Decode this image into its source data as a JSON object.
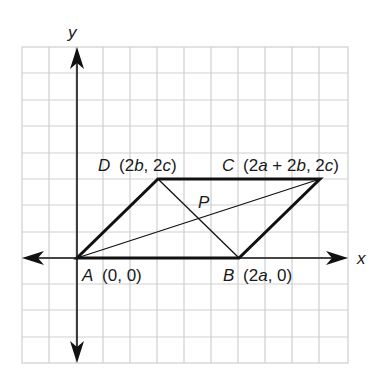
{
  "axes": {
    "x_label": "x",
    "y_label": "y"
  },
  "points": {
    "A": {
      "name": "A",
      "coords": "(0, 0)"
    },
    "B": {
      "name": "B",
      "coords": "(2a, 0)"
    },
    "C": {
      "name": "C",
      "coords": "(2a + 2b, 2c)"
    },
    "D": {
      "name": "D",
      "coords": "(2b, 2c)"
    },
    "P": {
      "name": "P"
    }
  },
  "figure": {
    "shape": "parallelogram ABCD",
    "diagonals": [
      "AC",
      "BD"
    ],
    "intersection": "P"
  },
  "colors": {
    "grid": "#cfcfcf",
    "lines": "#111111",
    "background": "#ffffff"
  }
}
